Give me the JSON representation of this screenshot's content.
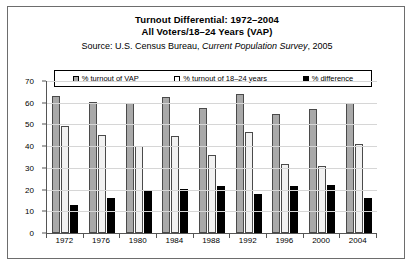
{
  "chart_data": {
    "type": "bar",
    "title": "Turnout Differential: 1972–2004",
    "subtitle": "All Voters/18–24 Years (VAP)",
    "source_prefix": "Source: U.S. Census Bureau, ",
    "source_italic": "Current Population Survey",
    "source_suffix": ", 2005",
    "xlabel": "",
    "ylabel": "",
    "ylim": [
      0,
      70
    ],
    "ytick_step": 10,
    "yticks": [
      0,
      10,
      20,
      30,
      40,
      50,
      60,
      70
    ],
    "grid": true,
    "legend_position": "top",
    "categories": [
      "1972",
      "1976",
      "1980",
      "1984",
      "1988",
      "1992",
      "1996",
      "2000",
      "2004"
    ],
    "series": [
      {
        "name": "% turnout of VAP",
        "color": "#a9a9a9",
        "values": [
          63,
          60.5,
          60,
          62.5,
          57.5,
          64,
          55,
          57,
          60
        ]
      },
      {
        "name": "% turnout of 18–24 years",
        "color": "#ffffff",
        "values": [
          49.5,
          45,
          40,
          44.5,
          36,
          46.5,
          32,
          31,
          41
        ]
      },
      {
        "name": "% difference",
        "color": "#000000",
        "values": [
          13,
          16,
          19.5,
          20.5,
          21.5,
          18,
          21.5,
          22,
          16
        ]
      }
    ]
  },
  "legend": {
    "items": [
      {
        "label": "% turnout of VAP",
        "swatch": "gray-swatch-icon"
      },
      {
        "label": "% turnout of 18–24 years",
        "swatch": "white-swatch-icon"
      },
      {
        "label": "% difference",
        "swatch": "black-swatch-icon"
      }
    ]
  }
}
